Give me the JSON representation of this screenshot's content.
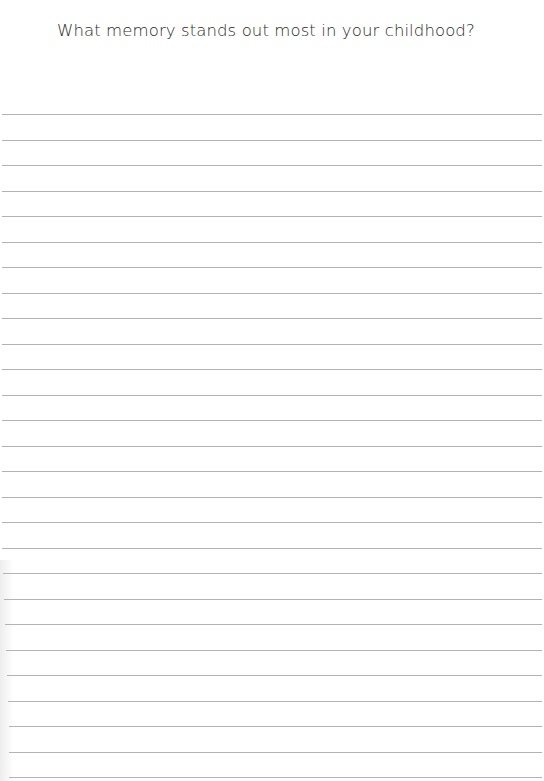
{
  "page": {
    "prompt": "What memory stands out most in your childhood?",
    "line_color": "#b3b3b3",
    "text_color": "#2a2a2a",
    "background": "#ffffff",
    "ruled_lines": {
      "count": 27,
      "first_y": 114,
      "spacing": 25.5
    }
  }
}
